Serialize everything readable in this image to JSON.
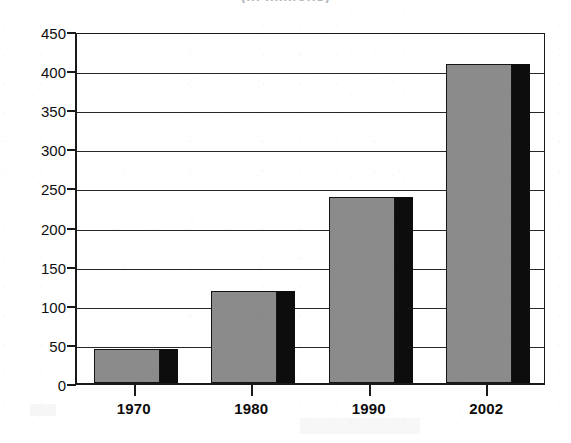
{
  "chart_data": {
    "type": "bar",
    "title": "(in millions)",
    "title_visible": false,
    "title_note": "title is cropped off the top edge; only the bottom of the parentheses is visible",
    "xlabel": "",
    "ylabel": "",
    "categories": [
      "1970",
      "1980",
      "1990",
      "2002"
    ],
    "values": [
      43,
      118,
      238,
      408
    ],
    "series": [
      {
        "name": "value",
        "values": [
          43,
          118,
          238,
          408
        ]
      }
    ],
    "ylim": [
      0,
      450
    ],
    "yticks": [
      0,
      50,
      100,
      150,
      200,
      250,
      300,
      350,
      400,
      450
    ],
    "ytick_labels": [
      "0",
      "50",
      "100",
      "150",
      "200",
      "250",
      "300",
      "350",
      "400",
      "450"
    ],
    "grid": "horizontal",
    "legend": "none",
    "bar_style": "3d-shadow",
    "colors": {
      "bar_face": "#8b8b8b",
      "bar_side": "#0d0d0d",
      "bar_outline": "#141414",
      "axis": "#1a1a1a",
      "gridline": "#262626",
      "text": "#0b0b0b",
      "background": "#ffffff"
    }
  }
}
